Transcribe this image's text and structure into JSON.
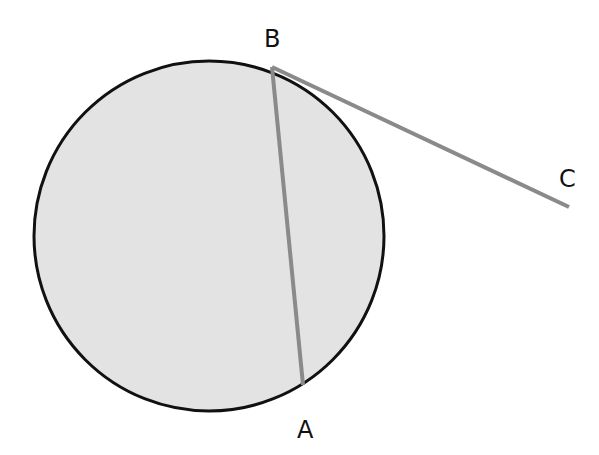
{
  "diagram": {
    "type": "circle-chord-tangent",
    "circle": {
      "cx": 209,
      "cy": 236,
      "r": 175,
      "fill": "#e3e3e3",
      "stroke": "#111111"
    },
    "points": [
      {
        "id": "A",
        "label": "A",
        "x": 303,
        "y": 385,
        "label_x": 297,
        "label_y": 438
      },
      {
        "id": "B",
        "label": "B",
        "x": 272,
        "y": 67,
        "label_x": 264,
        "label_y": 47
      },
      {
        "id": "C",
        "label": "C",
        "x": 569,
        "y": 207,
        "label_x": 559,
        "label_y": 187
      }
    ],
    "segments": [
      {
        "name": "chord-AB",
        "from": "A",
        "to": "B",
        "color": "#8a8a8a"
      },
      {
        "name": "tangent-BC",
        "from": "B",
        "to": "C",
        "color": "#8a8a8a"
      }
    ]
  }
}
